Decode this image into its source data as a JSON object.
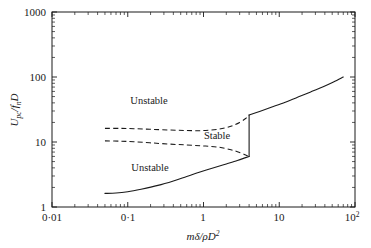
{
  "chart_data": {
    "type": "line",
    "title": "",
    "xlabel": "mδ/ρD²",
    "ylabel": "U_pc / f_n D",
    "xscale": "log",
    "yscale": "log",
    "xlim": [
      0.01,
      100
    ],
    "ylim": [
      1,
      1000
    ],
    "grid": false,
    "legend": null,
    "xticks": [
      "0·01",
      "0·1",
      "1",
      "10",
      "10²"
    ],
    "xtick_values": [
      0.01,
      0.1,
      1,
      10,
      100
    ],
    "yticks": [
      "1",
      "10",
      "100",
      "1000"
    ],
    "ytick_values": [
      1,
      10,
      100,
      1000
    ],
    "annotations": [
      {
        "text": "Unstable",
        "x": 0.28,
        "y": 45
      },
      {
        "text": "Stable",
        "x": 3.6,
        "y": 13.5
      },
      {
        "text": "Unstable",
        "x": 0.3,
        "y": 4.2
      }
    ],
    "series": [
      {
        "name": "lower-stability-boundary",
        "style": "solid",
        "points": [
          [
            0.05,
            1.62
          ],
          [
            0.07,
            1.64
          ],
          [
            0.1,
            1.72
          ],
          [
            0.15,
            1.88
          ],
          [
            0.25,
            2.15
          ],
          [
            0.4,
            2.52
          ],
          [
            0.6,
            2.95
          ],
          [
            0.9,
            3.45
          ],
          [
            1.4,
            4.05
          ],
          [
            2.0,
            4.6
          ],
          [
            2.8,
            5.2
          ],
          [
            3.6,
            5.75
          ],
          [
            4.0,
            6.0
          ]
        ]
      },
      {
        "name": "hysteresis-jump",
        "style": "solid",
        "points": [
          [
            4.0,
            6.0
          ],
          [
            4.0,
            26.0
          ]
        ]
      },
      {
        "name": "upper-stability-boundary",
        "style": "solid",
        "points": [
          [
            4.0,
            26.0
          ],
          [
            5.5,
            29.5
          ],
          [
            8.0,
            34.5
          ],
          [
            12.0,
            41.0
          ],
          [
            18.0,
            49.5
          ],
          [
            26.0,
            59.0
          ],
          [
            38.0,
            71.0
          ],
          [
            52.0,
            84.0
          ],
          [
            70.0,
            100.0
          ]
        ]
      },
      {
        "name": "stable-region-upper-edge",
        "style": "dashed",
        "points": [
          [
            0.05,
            16.2
          ],
          [
            0.08,
            16.2
          ],
          [
            0.12,
            16.0
          ],
          [
            0.2,
            15.7
          ],
          [
            0.35,
            15.3
          ],
          [
            0.6,
            15.0
          ],
          [
            1.0,
            15.0
          ],
          [
            1.6,
            15.8
          ],
          [
            2.3,
            17.5
          ],
          [
            3.0,
            20.0
          ],
          [
            3.6,
            23.0
          ],
          [
            4.0,
            26.0
          ]
        ]
      },
      {
        "name": "stable-region-lower-edge",
        "style": "dashed",
        "points": [
          [
            0.05,
            10.4
          ],
          [
            0.08,
            10.3
          ],
          [
            0.12,
            10.1
          ],
          [
            0.2,
            9.7
          ],
          [
            0.35,
            9.3
          ],
          [
            0.6,
            9.0
          ],
          [
            1.0,
            8.7
          ],
          [
            1.6,
            8.3
          ],
          [
            2.3,
            7.6
          ],
          [
            3.0,
            6.9
          ],
          [
            3.6,
            6.3
          ],
          [
            4.0,
            6.0
          ]
        ]
      }
    ]
  },
  "axes": {
    "x_axis_label": "mδ/ρD²",
    "x_axis_label_parts": {
      "m": "m",
      "delta": "δ",
      "slash": "/",
      "rho": "ρ",
      "D": "D",
      "exp": "2"
    },
    "y_axis_label": "U_pc/f_nD",
    "y_axis_label_parts": {
      "U": "U",
      "pc": "pc",
      "slash": "/",
      "f": "f",
      "n": "n",
      "D": "D"
    }
  },
  "labels": {
    "unstable_upper": "Unstable",
    "stable": "Stable",
    "unstable_lower": "Unstable"
  },
  "x_tick_labels": {
    "t0": "0·01",
    "t1": "0·1",
    "t2": "1",
    "t3": "10",
    "t4_base": "10",
    "t4_exp": "2"
  },
  "y_tick_labels": {
    "t0": "1",
    "t1": "10",
    "t2": "100",
    "t3": "1000"
  },
  "colors": {
    "background": "#ffffff",
    "ink": "#1a1a1a"
  }
}
